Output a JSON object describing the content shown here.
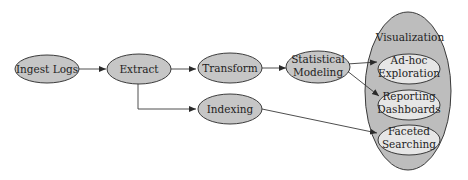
{
  "diagram": {
    "type": "flowchart",
    "colors": {
      "node_fill": "#c6c6c6",
      "inner_node_fill": "#e6e6e6",
      "group_fill": "#bdbdbd",
      "stroke": "#3a3a3a",
      "text": "#1e1e1e"
    },
    "nodes": {
      "ingest": {
        "label": "Ingest Logs"
      },
      "extract": {
        "label": "Extract"
      },
      "transform": {
        "label": "Transform"
      },
      "modeling": {
        "line1": "Statistical",
        "line2": "Modeling"
      },
      "indexing": {
        "label": "Indexing"
      },
      "visualization": {
        "label": "Visualization",
        "children": {
          "adhoc": {
            "line1": "Ad-hoc",
            "line2": "Exploration"
          },
          "reporting": {
            "line1": "Reporting",
            "line2": "Dashboards"
          },
          "faceted": {
            "line1": "Faceted",
            "line2": "Searching"
          }
        }
      }
    },
    "edges": [
      {
        "from": "Ingest Logs",
        "to": "Extract"
      },
      {
        "from": "Extract",
        "to": "Transform"
      },
      {
        "from": "Extract",
        "to": "Indexing"
      },
      {
        "from": "Transform",
        "to": "Statistical Modeling"
      },
      {
        "from": "Statistical Modeling",
        "to": "Ad-hoc Exploration"
      },
      {
        "from": "Statistical Modeling",
        "to": "Reporting Dashboards"
      },
      {
        "from": "Indexing",
        "to": "Faceted Searching"
      }
    ]
  }
}
